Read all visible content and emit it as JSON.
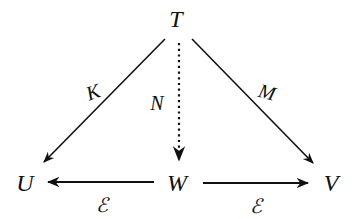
{
  "diagram": {
    "nodes": {
      "T": {
        "label": "T",
        "x": 176,
        "y": 19
      },
      "U": {
        "label": "U",
        "x": 25,
        "y": 183
      },
      "W": {
        "label": "W",
        "x": 177,
        "y": 183
      },
      "V": {
        "label": "V",
        "x": 331,
        "y": 183
      }
    },
    "edges": {
      "T_U": {
        "from": "T",
        "to": "U",
        "label": "K",
        "style": "solid"
      },
      "T_W": {
        "from": "T",
        "to": "W",
        "label": "N",
        "style": "dotted"
      },
      "T_V": {
        "from": "T",
        "to": "V",
        "label": "M",
        "style": "solid"
      },
      "W_U": {
        "from": "W",
        "to": "U",
        "label": "ℰ",
        "style": "solid"
      },
      "W_V": {
        "from": "W",
        "to": "V",
        "label": "ℰ",
        "style": "solid"
      }
    },
    "colors": {
      "ink": "#111111",
      "background": "#ffffff"
    }
  }
}
